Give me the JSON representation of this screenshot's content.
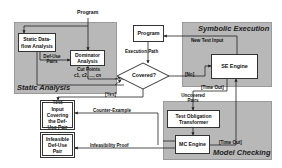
{
  "diagram": {
    "top_input": "Program",
    "regions": {
      "static_analysis": "Static Analysis",
      "symbolic_execution": "Symbolic Execution",
      "model_checking": "Model Checking"
    },
    "nodes": {
      "static_dataflow": "Static Data-flow Analysis",
      "dominator": "Dominator Analysis",
      "program": "Program",
      "covered": "Covered?",
      "se_engine": "SE Engine",
      "test_obligation": "Test Obligation Transformer",
      "mc_engine": "MC Engine",
      "test_input": "Test Input Covering the Def-Use Pair",
      "infeasible": "Infeasible Def-Use Pair"
    },
    "edge_labels": {
      "def_use_pairs": "Def-Use Pairs",
      "cut_points": "Cut Points",
      "cut_points_seq": "c1, c2, ..., cn",
      "execution_path": "Execution Path",
      "new_test_input": "New Test Input",
      "no": "[No]",
      "yes": "[Yes]",
      "time_out_se": "[Time Out]",
      "uncovered_pairs": "Uncovered Pairs",
      "time_out_mc": "[Time Out]",
      "counter_example": "Counter-Example",
      "infeasibility_proof": "Infeasibility Proof"
    }
  }
}
